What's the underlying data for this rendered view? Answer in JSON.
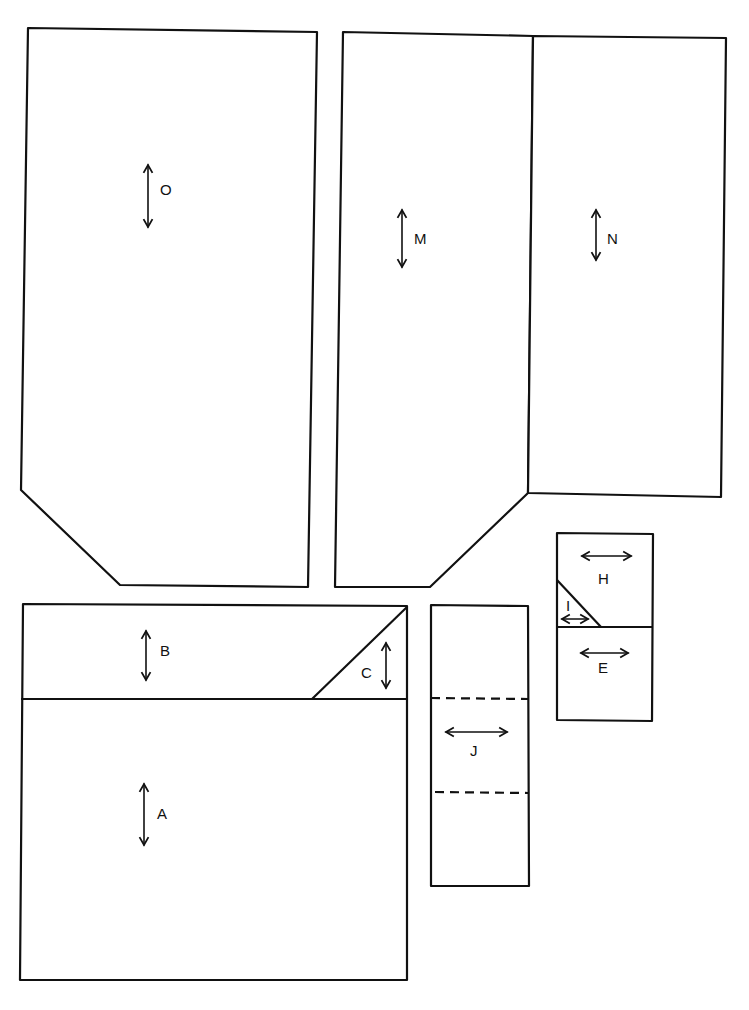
{
  "diagram": {
    "title": "",
    "colors": {
      "stroke": "#111111",
      "background": "#ffffff"
    },
    "pieces": [
      {
        "id": "O",
        "label": "O",
        "grainline": "vertical"
      },
      {
        "id": "M",
        "label": "M",
        "grainline": "vertical"
      },
      {
        "id": "N",
        "label": "N",
        "grainline": "vertical"
      },
      {
        "id": "B",
        "label": "B",
        "grainline": "vertical"
      },
      {
        "id": "C",
        "label": "C",
        "grainline": "vertical"
      },
      {
        "id": "A",
        "label": "A",
        "grainline": "vertical"
      },
      {
        "id": "J",
        "label": "J",
        "grainline": "horizontal",
        "fold_lines": 2
      },
      {
        "id": "H",
        "label": "H",
        "grainline": "horizontal"
      },
      {
        "id": "I",
        "label": "I",
        "grainline": "horizontal"
      },
      {
        "id": "E",
        "label": "E",
        "grainline": "horizontal"
      }
    ]
  }
}
